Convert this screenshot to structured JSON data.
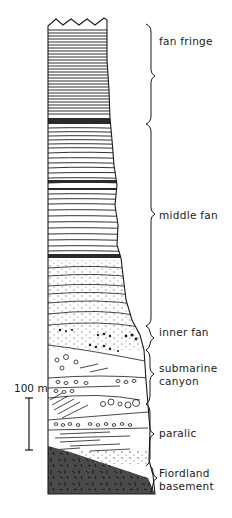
{
  "figure": {
    "type": "stratigraphic-column",
    "colors": {
      "ink": "#1a1a1a",
      "basement": "#4a4a4a",
      "dark_band": "#2a2a2a",
      "paper": "#ffffff"
    },
    "scale_bar": {
      "label": "100 m"
    },
    "units": [
      {
        "id": "fan-fringe",
        "label": "fan fringe",
        "lines": [
          "fan fringe"
        ]
      },
      {
        "id": "middle-fan",
        "label": "middle fan",
        "lines": [
          "middle fan"
        ]
      },
      {
        "id": "inner-fan",
        "label": "inner fan",
        "lines": [
          "inner fan"
        ]
      },
      {
        "id": "submarine-canyon",
        "label": "submarine canyon",
        "lines": [
          "submarine",
          "canyon"
        ]
      },
      {
        "id": "paralic",
        "label": "paralic",
        "lines": [
          "paralic"
        ]
      },
      {
        "id": "fiordland-basement",
        "label": "Fiordland basement",
        "lines": [
          "Fiordland",
          "basement"
        ]
      }
    ]
  }
}
